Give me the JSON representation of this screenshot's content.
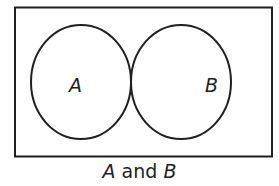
{
  "diagram": {
    "type": "venn",
    "sets": [
      {
        "label": "A"
      },
      {
        "label": "B"
      }
    ],
    "shaded_region": "A ∩ B",
    "shade_color": "#d4d4d4",
    "stroke_color": "#231f20"
  },
  "caption": {
    "left": "A",
    "middle": " and ",
    "right": "B"
  }
}
